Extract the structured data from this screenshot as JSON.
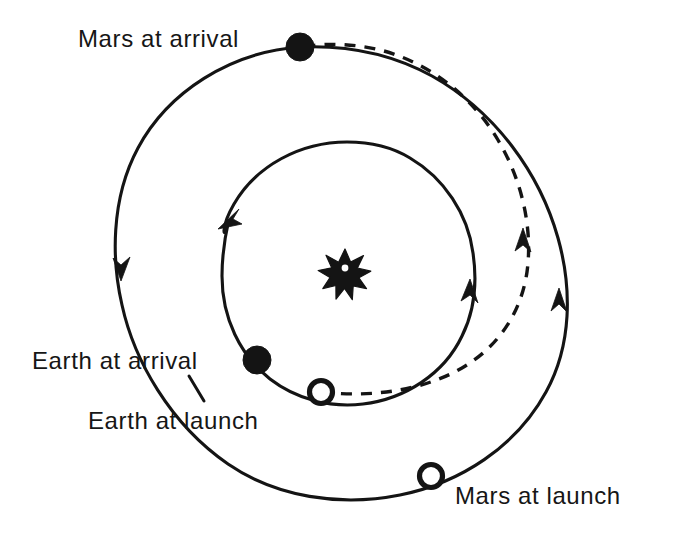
{
  "figure": {
    "kind": "orbital-transfer-diagram",
    "background_color": "#ffffff",
    "ink_color": "#141414"
  },
  "labels": {
    "mars_at_arrival": "Mars at arrival",
    "earth_at_arrival": "Earth at arrival",
    "earth_at_launch": "Earth at  launch",
    "mars_at_launch": "Mars at launch"
  },
  "bodies": {
    "sun": {
      "name": "sun-star",
      "x": 345,
      "y": 268,
      "radius": 19,
      "points": 10
    },
    "mars_arrival": {
      "marker": "filled-circle",
      "x": 300,
      "y": 47,
      "radius": 14
    },
    "earth_arrival": {
      "marker": "filled-circle",
      "x": 257,
      "y": 360,
      "radius": 14
    },
    "earth_launch": {
      "marker": "open-circle",
      "x": 321,
      "y": 392,
      "radius": 12
    },
    "mars_launch": {
      "marker": "open-circle",
      "x": 431,
      "y": 476,
      "radius": 12
    }
  },
  "orbits": {
    "mars_orbit": {
      "label": "outer-orbit-mars",
      "style": "solid",
      "cx": 342,
      "cy": 272,
      "rx": 224,
      "ry": 226,
      "direction": "counterclockwise"
    },
    "earth_orbit": {
      "label": "inner-orbit-earth",
      "style": "solid",
      "cx": 347,
      "cy": 273,
      "rx": 126,
      "ry": 131,
      "direction": "counterclockwise"
    },
    "transfer_orbit": {
      "label": "hohmann-transfer-arc",
      "style": "dashed",
      "from": "earth_launch",
      "to": "mars_arrival",
      "direction": "counterclockwise"
    }
  },
  "arrows": [
    {
      "name": "mars-orbit-arrow-left",
      "x": 122,
      "y": 268,
      "rotation": 180
    },
    {
      "name": "mars-orbit-arrow-right",
      "x": 560,
      "y": 302,
      "rotation": 0
    },
    {
      "name": "earth-orbit-arrow-left",
      "x": 229,
      "y": 219,
      "rotation": 205
    },
    {
      "name": "earth-orbit-arrow-right",
      "x": 469,
      "y": 292,
      "rotation": 352
    },
    {
      "name": "transfer-arrow",
      "x": 523,
      "y": 241,
      "rotation": 2
    }
  ]
}
